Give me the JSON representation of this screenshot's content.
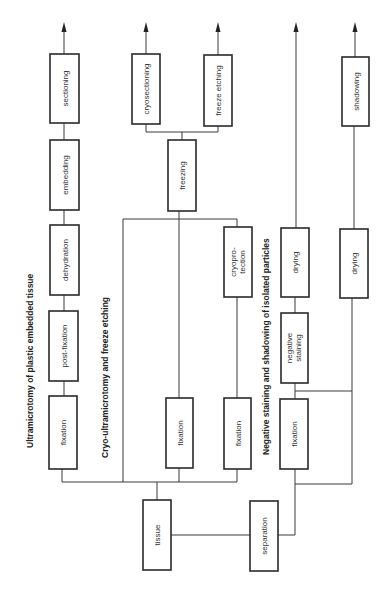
{
  "diagram": {
    "orientation": "rotated-90-ccw",
    "titles": {
      "plastic": "Ultramicrotomy of plastic embedded tissue",
      "cryo": "Cryo-ultramicrotomy and freeze etching",
      "negative": "Negative staining and shadowing of isolated particles"
    },
    "nodes": {
      "tissue": "tissue",
      "separation": "separation",
      "plastic_fixation": "fixation",
      "post_fixation": "post-fixation",
      "dehydration": "dehydration",
      "embedding": "embedding",
      "sectioning": "sectioning",
      "cryo_fixation_a": "fixation",
      "cryo_fixation_b": "fixation",
      "cryoprotection_1": "cryopro-",
      "cryoprotection_2": "tection",
      "freezing": "freezing",
      "cryosectioning": "cryosectioning",
      "freeze_etching": "freeze etching",
      "neg_fixation": "fixation",
      "negative_staining_1": "negative",
      "negative_staining_2": "staining",
      "drying_neg": "drying",
      "drying_shadow": "drying",
      "shadowing": "shadowing"
    },
    "colors": {
      "stroke": "#2a2a2a",
      "text": "#333333",
      "background": "#ffffff"
    }
  }
}
